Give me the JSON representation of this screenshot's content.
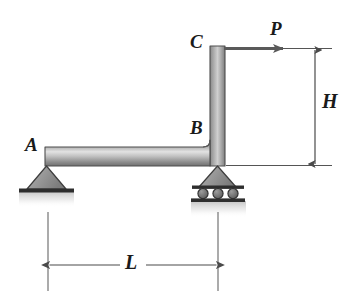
{
  "figure": {
    "type": "statics-free-body-diagram",
    "background_color": "#ffffff"
  },
  "labels": {
    "point_a": "A",
    "point_b": "B",
    "point_c": "C",
    "load_p": "P",
    "dim_height": "H",
    "dim_length": "L"
  },
  "members": {
    "horizontal_beam": {
      "name": "beam-ab",
      "from": "A",
      "to": "B",
      "orientation": "horizontal"
    },
    "vertical_beam": {
      "name": "column-bc",
      "from": "B",
      "to": "C",
      "orientation": "vertical"
    }
  },
  "supports": {
    "a": {
      "type": "pin",
      "label": "A"
    },
    "b": {
      "type": "roller",
      "label": "B",
      "roller_count": 3
    }
  },
  "loads": {
    "p": {
      "label": "P",
      "direction": "horizontal-right",
      "applied_at": "C"
    }
  },
  "dimensions": {
    "height": {
      "label": "H",
      "orientation": "vertical",
      "between": [
        "C",
        "B"
      ]
    },
    "length": {
      "label": "L",
      "orientation": "horizontal",
      "between": [
        "A",
        "B"
      ]
    }
  },
  "colors": {
    "member_dark": "#6e6e6e",
    "member_light": "#d9d9d9",
    "support_fill": "#8e8e8e",
    "outline": "#2b2b2b",
    "dimension_line": "#555555"
  }
}
